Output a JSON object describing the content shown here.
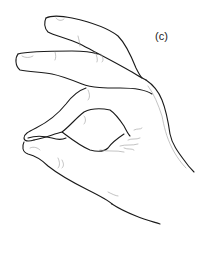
{
  "figure": {
    "label": "(c)",
    "stroke_color": "#1a1a1a",
    "detail_color": "#9a9a9a",
    "background": "#ffffff"
  }
}
